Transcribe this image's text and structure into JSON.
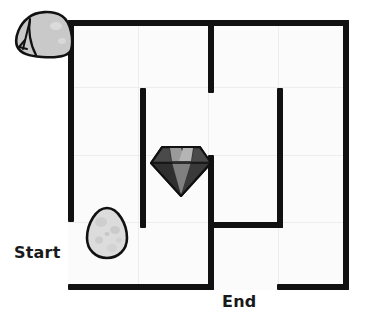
{
  "canvas": {
    "width": 367,
    "height": 325,
    "background": "#ffffff",
    "board_background": "#fbfbfb",
    "wall_color": "#111111",
    "grid_color": "#ededed",
    "label_color": "#1a1a1a"
  },
  "puzzle": {
    "type": "grid-maze",
    "title": "Maze with Start and End",
    "grid_columns": 4,
    "grid_rows": 4,
    "board": {
      "x": 68,
      "y": 20,
      "width": 281,
      "height": 270
    }
  },
  "labels": {
    "start": "Start",
    "end": "End"
  },
  "openings": [
    {
      "name": "start-opening",
      "side": "left",
      "label": "Start",
      "from": 222,
      "to": 290
    },
    {
      "name": "end-opening",
      "side": "bottom",
      "label": "End",
      "from": 208,
      "to": 277
    }
  ],
  "walls": [
    {
      "name": "outer-wall-top",
      "orient": "h",
      "x": 68,
      "y": 20,
      "length": 281
    },
    {
      "name": "outer-wall-right",
      "orient": "v",
      "x": 343,
      "y": 20,
      "length": 270
    },
    {
      "name": "outer-wall-left-upper",
      "orient": "v",
      "x": 68,
      "y": 20,
      "length": 202
    },
    {
      "name": "outer-wall-bottom-left",
      "orient": "h",
      "x": 68,
      "y": 284,
      "length": 146
    },
    {
      "name": "outer-wall-bottom-right",
      "orient": "h",
      "x": 277,
      "y": 284,
      "length": 72
    },
    {
      "name": "inner-wall-center-upper",
      "orient": "v",
      "x": 208,
      "y": 20,
      "length": 73
    },
    {
      "name": "inner-wall-center-lower",
      "orient": "v",
      "x": 208,
      "y": 155,
      "length": 135
    },
    {
      "name": "inner-wall-middle-left",
      "orient": "v",
      "x": 140,
      "y": 88,
      "length": 140
    },
    {
      "name": "inner-wall-right-vertical",
      "orient": "v",
      "x": 277,
      "y": 88,
      "length": 140
    },
    {
      "name": "inner-wall-chamber-floor",
      "orient": "h",
      "x": 208,
      "y": 222,
      "length": 75
    }
  ],
  "grid_lines": {
    "vertical_x": [
      138,
      208,
      278
    ],
    "horizontal_y": [
      87,
      155,
      222
    ]
  },
  "objects": [
    {
      "name": "tent",
      "icon": "tent-icon",
      "label": "Tent",
      "cell": {
        "row": 1,
        "col": 1
      },
      "fill": "#c9c9c9",
      "stroke": "#111111"
    },
    {
      "name": "diamond",
      "icon": "diamond-icon",
      "label": "Diamond",
      "cell": {
        "row": 3,
        "col": 3
      },
      "fill": "#3a3a3a",
      "stroke": "#111111"
    },
    {
      "name": "egg",
      "icon": "egg-icon",
      "label": "Egg",
      "cell": {
        "row": 4,
        "col": 2
      },
      "fill": "#d8d8d8",
      "stroke": "#111111"
    }
  ]
}
